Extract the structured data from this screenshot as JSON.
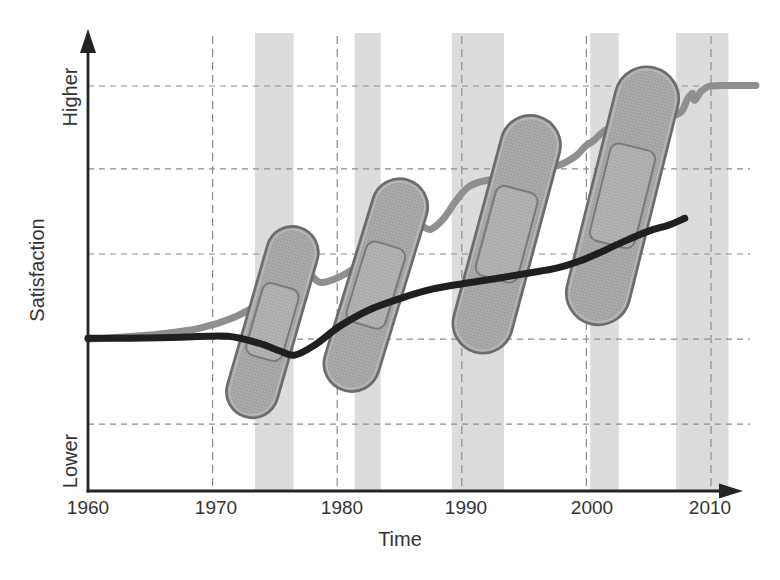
{
  "figure": {
    "ylabel": "Satisfaction",
    "xlabel": "Time",
    "y_axis_high": "Higher",
    "y_axis_low": "Lower"
  },
  "chart_data": {
    "type": "line",
    "title": "",
    "xlabel": "Time",
    "ylabel": "Satisfaction",
    "x_ticks": [
      1960,
      1970,
      1980,
      1990,
      2000,
      2010
    ],
    "x_range": [
      1960,
      2013.6
    ],
    "y_range_units": [
      0,
      100
    ],
    "y_axis_annotations": [
      "Lower",
      "Higher"
    ],
    "grid": "dashed",
    "y_gridline_values": [
      14.6,
      33.2,
      51.8,
      70.4,
      88.5
    ],
    "legend": "none",
    "series": [
      {
        "name": "gray curve (patched satisfaction)",
        "color": "#8f8f8f",
        "points": [
          [
            1960.0,
            33.2
          ],
          [
            1962.6,
            33.6
          ],
          [
            1965.8,
            34.3
          ],
          [
            1969.0,
            35.6
          ],
          [
            1971.6,
            37.8
          ],
          [
            1973.7,
            40.8
          ],
          [
            1975.3,
            43.7
          ],
          [
            1976.6,
            46.5
          ],
          [
            1977.7,
            47.4
          ],
          [
            1978.6,
            45.6
          ],
          [
            1979.8,
            46.3
          ],
          [
            1981.4,
            48.7
          ],
          [
            1983.3,
            52.4
          ],
          [
            1985.1,
            55.5
          ],
          [
            1986.5,
            57.9
          ],
          [
            1987.5,
            57.2
          ],
          [
            1988.5,
            59.4
          ],
          [
            1989.5,
            63.3
          ],
          [
            1990.5,
            66.4
          ],
          [
            1991.7,
            67.7
          ],
          [
            1993.5,
            68.6
          ],
          [
            1995.5,
            69.9
          ],
          [
            1997.8,
            71.2
          ],
          [
            1999.1,
            73.1
          ],
          [
            1999.9,
            75.3
          ],
          [
            2000.6,
            76.6
          ],
          [
            2001.5,
            78.8
          ],
          [
            2002.9,
            80.3
          ],
          [
            2004.7,
            81.0
          ],
          [
            2006.6,
            81.7
          ],
          [
            2007.6,
            82.8
          ],
          [
            2008.1,
            85.6
          ],
          [
            2008.5,
            86.9
          ],
          [
            2008.7,
            85.4
          ],
          [
            2009.2,
            87.3
          ],
          [
            2009.8,
            88.4
          ],
          [
            2010.8,
            88.6
          ],
          [
            2013.6,
            88.6
          ]
        ]
      },
      {
        "name": "black curve (underlying satisfaction)",
        "color": "#1f1f1f",
        "points": [
          [
            1960.0,
            33.4
          ],
          [
            1963.4,
            33.4
          ],
          [
            1967.4,
            33.6
          ],
          [
            1971.2,
            33.8
          ],
          [
            1973.7,
            32.3
          ],
          [
            1975.4,
            30.6
          ],
          [
            1976.6,
            29.7
          ],
          [
            1978.2,
            31.9
          ],
          [
            1980.2,
            36.0
          ],
          [
            1982.5,
            39.5
          ],
          [
            1985.1,
            42.1
          ],
          [
            1987.6,
            44.1
          ],
          [
            1990.3,
            45.4
          ],
          [
            1992.9,
            46.5
          ],
          [
            1995.3,
            47.6
          ],
          [
            1997.6,
            48.7
          ],
          [
            1999.4,
            50.2
          ],
          [
            2001.0,
            52.0
          ],
          [
            2002.9,
            54.4
          ],
          [
            2005.0,
            56.8
          ],
          [
            2006.6,
            58.1
          ],
          [
            2007.9,
            59.6
          ]
        ]
      }
    ],
    "shaded_periods": [
      [
        1973.4,
        1976.5
      ],
      [
        1981.4,
        1983.5
      ],
      [
        1989.2,
        1993.4
      ],
      [
        2000.3,
        2002.6
      ],
      [
        2007.2,
        2011.4
      ]
    ],
    "bandaids": [
      {
        "center_year": 1974.8,
        "center_value": 36.9,
        "angle_deg": 16,
        "length_px": 197,
        "width_px": 52
      },
      {
        "center_year": 1983.1,
        "center_value": 45.0,
        "angle_deg": 17,
        "length_px": 220,
        "width_px": 56
      },
      {
        "center_year": 1993.6,
        "center_value": 56.1,
        "angle_deg": 15,
        "length_px": 244,
        "width_px": 60
      },
      {
        "center_year": 2002.9,
        "center_value": 64.5,
        "angle_deg": 14,
        "length_px": 264,
        "width_px": 64
      }
    ],
    "colors": {
      "gray_line": "#8f8f8f",
      "black_line": "#1f1f1f",
      "shaded_band": "#dcdcdc",
      "gridline": "#8c8c8c",
      "axis": "#242424",
      "bandaid_fill": "#a9a9a9",
      "bandaid_stroke": "#6b6b6b",
      "bandaid_pad_fill": "#b2b2b2",
      "bandaid_pad_stroke": "#7a7a7a"
    }
  }
}
